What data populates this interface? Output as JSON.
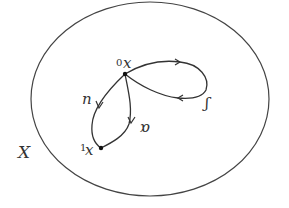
{
  "diagram": {
    "space_label": "X",
    "points": [
      {
        "id": "x0",
        "prefix": "0",
        "letter": "x",
        "cx": 125,
        "cy": 74
      },
      {
        "id": "x1",
        "prefix": "1",
        "letter": "x",
        "cx": 101,
        "cy": 148
      }
    ],
    "paths": [
      {
        "id": "path-left",
        "label": "n"
      },
      {
        "id": "path-right",
        "label": "ɑ"
      },
      {
        "id": "loop",
        "label": "ʃ"
      }
    ],
    "colors": {
      "stroke": "#333333",
      "background": "#ffffff"
    }
  }
}
